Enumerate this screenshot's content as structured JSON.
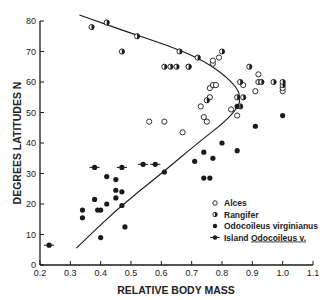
{
  "chart_data": {
    "type": "scatter",
    "title": "",
    "xlabel": "RELATIVE BODY MASS",
    "ylabel": "DEGREES LATITUDES N",
    "xlim": [
      0.2,
      1.1
    ],
    "ylim": [
      0,
      80
    ],
    "x_ticks": [
      "0.2",
      "0.3",
      "0.4",
      "0.5",
      "0.6",
      "0.7",
      "0.8",
      "0.9",
      "1.0",
      "1.1"
    ],
    "y_ticks": [
      "0",
      "10",
      "20",
      "30",
      "40",
      "50",
      "60",
      "70",
      "80"
    ],
    "grid": false,
    "legend_position": "lower right",
    "series": [
      {
        "name": "Alces",
        "marker": "open-circle",
        "points": [
          [
            0.56,
            47
          ],
          [
            0.61,
            47
          ],
          [
            0.67,
            43.5
          ],
          [
            0.69,
            65
          ],
          [
            0.73,
            52
          ],
          [
            0.74,
            48.5
          ],
          [
            0.75,
            47
          ],
          [
            0.76,
            55
          ],
          [
            0.76,
            58
          ],
          [
            0.77,
            59
          ],
          [
            0.77,
            66
          ],
          [
            0.77,
            67
          ],
          [
            0.78,
            59
          ],
          [
            0.79,
            68
          ],
          [
            0.83,
            51
          ],
          [
            0.85,
            49
          ],
          [
            0.87,
            59
          ],
          [
            0.91,
            57
          ],
          [
            0.92,
            62.5
          ],
          [
            1.0,
            57
          ],
          [
            1.0,
            58
          ]
        ]
      },
      {
        "name": "Rangifer",
        "marker": "half-filled-circle",
        "points": [
          [
            0.37,
            78
          ],
          [
            0.42,
            79.5
          ],
          [
            0.47,
            70
          ],
          [
            0.52,
            75
          ],
          [
            0.61,
            65
          ],
          [
            0.63,
            65
          ],
          [
            0.65,
            65
          ],
          [
            0.66,
            70
          ],
          [
            0.69,
            65
          ],
          [
            0.72,
            68
          ],
          [
            0.75,
            54
          ],
          [
            0.8,
            70
          ],
          [
            0.85,
            55
          ],
          [
            0.86,
            60
          ],
          [
            0.87,
            55
          ],
          [
            0.89,
            65
          ],
          [
            0.92,
            60
          ],
          [
            0.93,
            60
          ],
          [
            0.97,
            60
          ],
          [
            1.0,
            59
          ],
          [
            1.0,
            60
          ],
          [
            0.86,
            52
          ]
        ]
      },
      {
        "name": "Odocoileus virginianus",
        "marker": "filled-circle",
        "points": [
          [
            0.34,
            18
          ],
          [
            0.34,
            15.5
          ],
          [
            0.38,
            21.5
          ],
          [
            0.39,
            18
          ],
          [
            0.4,
            18
          ],
          [
            0.4,
            9
          ],
          [
            0.42,
            29
          ],
          [
            0.42,
            20
          ],
          [
            0.45,
            28
          ],
          [
            0.45,
            24.5
          ],
          [
            0.45,
            22
          ],
          [
            0.47,
            24
          ],
          [
            0.47,
            19.5
          ],
          [
            0.48,
            12.5
          ],
          [
            0.61,
            30.5
          ],
          [
            0.71,
            34
          ],
          [
            0.74,
            37
          ],
          [
            0.74,
            28.5
          ],
          [
            0.76,
            28.5
          ],
          [
            0.77,
            35
          ],
          [
            0.8,
            40
          ],
          [
            0.85,
            52
          ],
          [
            0.85,
            37.5
          ],
          [
            0.91,
            45.5
          ],
          [
            1.0,
            49
          ]
        ]
      },
      {
        "name": "Island Odocoileus v.",
        "marker": "filled-circle-with-bar",
        "points": [
          [
            0.23,
            6.5
          ],
          [
            0.38,
            32
          ],
          [
            0.47,
            32
          ],
          [
            0.54,
            33
          ],
          [
            0.58,
            33
          ]
        ]
      }
    ],
    "fit_curve": {
      "description": "Hand-drawn regression curve bending from upper-left to ~0.86 at 50°N and back to lower-left",
      "points": [
        [
          0.32,
          5.5
        ],
        [
          0.45,
          18
        ],
        [
          0.6,
          30
        ],
        [
          0.72,
          40
        ],
        [
          0.81,
          47
        ],
        [
          0.855,
          52
        ],
        [
          0.86,
          55
        ],
        [
          0.85,
          58
        ],
        [
          0.8,
          63
        ],
        [
          0.72,
          68
        ],
        [
          0.62,
          72
        ],
        [
          0.5,
          76
        ],
        [
          0.4,
          79.5
        ],
        [
          0.33,
          82
        ]
      ]
    }
  },
  "legend": {
    "items": [
      {
        "label": "Alces",
        "marker": "open-circle"
      },
      {
        "label": "Rangifer",
        "marker": "half-filled-circle"
      },
      {
        "label": "Odocoileus virginianus",
        "marker": "filled-circle"
      },
      {
        "label": "Island ",
        "label_underlined": "Odocoileus v.",
        "marker": "filled-circle-with-bar"
      }
    ]
  },
  "colors": {
    "ink": "#1a1a1a",
    "background": "#ffffff"
  }
}
